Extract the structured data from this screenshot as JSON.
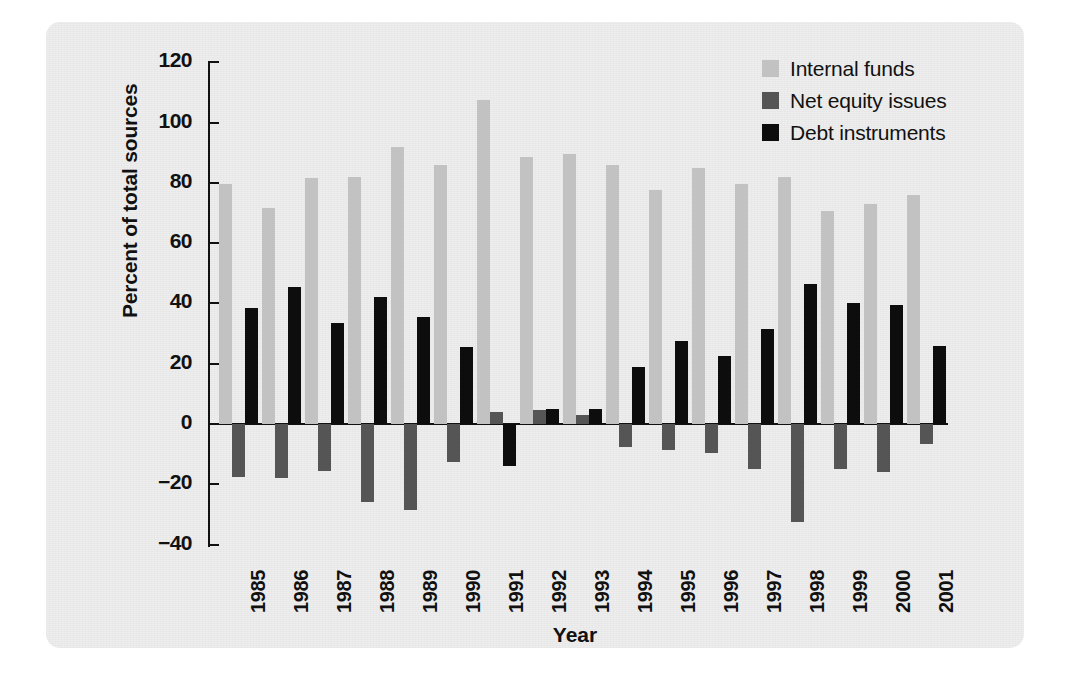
{
  "chart_data": {
    "type": "bar",
    "title": "",
    "xlabel": "Year",
    "ylabel": "Percent of total sources",
    "ylim": [
      -40,
      120
    ],
    "yticks": [
      120,
      100,
      80,
      60,
      40,
      20,
      0,
      -20,
      -40
    ],
    "ytick_labels": [
      "120",
      "100",
      "80",
      "60",
      "40",
      "20",
      "0",
      "−20",
      "−40"
    ],
    "grid": false,
    "legend_position": "top-right",
    "categories": [
      "1985",
      "1986",
      "1987",
      "1988",
      "1989",
      "1990",
      "1991",
      "1992",
      "1993",
      "1994",
      "1995",
      "1996",
      "1997",
      "1998",
      "1999",
      "2000",
      "2001"
    ],
    "series": [
      {
        "name": "Internal funds",
        "color": "#c2c2c2",
        "values": [
          79.5,
          71.5,
          81.5,
          82.0,
          92.0,
          86.0,
          107.5,
          88.5,
          89.5,
          86.0,
          77.5,
          85.0,
          79.5,
          82.0,
          70.5,
          73.0,
          76.0
        ]
      },
      {
        "name": "Net equity issues",
        "color": "#555555",
        "values": [
          -17.5,
          -18.0,
          -15.5,
          -26.0,
          -28.5,
          -12.5,
          4.0,
          4.5,
          3.0,
          -7.5,
          -8.5,
          -9.5,
          -15.0,
          -32.5,
          -15.0,
          -16.0,
          -6.5
        ]
      },
      {
        "name": "Debt instruments",
        "color": "#0d0d0d",
        "values": [
          38.5,
          45.5,
          33.5,
          42.0,
          35.5,
          25.5,
          -14.0,
          5.0,
          5.0,
          19.0,
          27.5,
          22.5,
          31.5,
          46.5,
          40.0,
          39.5,
          26.0
        ]
      }
    ]
  },
  "legend": {
    "items": [
      {
        "label": "Internal funds",
        "color": "#c2c2c2"
      },
      {
        "label": "Net equity issues",
        "color": "#555555"
      },
      {
        "label": "Debt instruments",
        "color": "#0d0d0d"
      }
    ]
  },
  "axes": {
    "y_title": "Percent of total sources",
    "x_title": "Year"
  }
}
